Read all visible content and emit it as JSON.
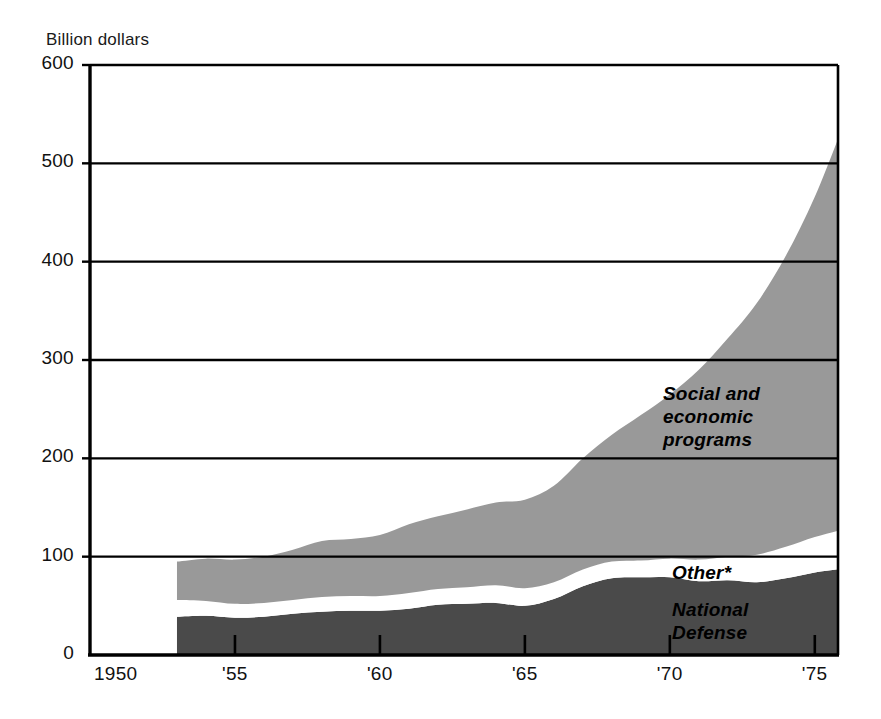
{
  "chart_data": {
    "type": "area",
    "title": "",
    "ylabel": "Billion dollars",
    "xlabel": "",
    "stacked": true,
    "grid": true,
    "legend_position": "inside-plot",
    "ylim": [
      0,
      600
    ],
    "xlim": [
      1950,
      1975.8
    ],
    "ytick_labels": [
      "600",
      "500",
      "400",
      "300",
      "200",
      "100",
      "0"
    ],
    "ytick_values": [
      600,
      500,
      400,
      300,
      200,
      100,
      0
    ],
    "xtick_labels": [
      "1950",
      "'55",
      "'60",
      "'65",
      "'70",
      "'75"
    ],
    "xtick_values": [
      1950,
      1955,
      1960,
      1965,
      1970,
      1975
    ],
    "x": [
      1953,
      1954,
      1955,
      1956,
      1957,
      1958,
      1959,
      1960,
      1961,
      1962,
      1963,
      1964,
      1965,
      1966,
      1967,
      1968,
      1969,
      1970,
      1971,
      1972,
      1973,
      1974,
      1975,
      1976
    ],
    "series": [
      {
        "name": "National Defense",
        "color": "#4a4a4a",
        "label": "National\nDefense",
        "values": [
          39,
          40,
          38,
          39,
          42,
          44,
          45,
          45,
          47,
          51,
          52,
          53,
          50,
          57,
          70,
          78,
          79,
          79,
          75,
          76,
          74,
          78,
          84,
          88
        ]
      },
      {
        "name": "Other*",
        "color": "#ffffff",
        "label": "Other*",
        "values": [
          17,
          15,
          14,
          14,
          14,
          15,
          15,
          15,
          16,
          16,
          17,
          18,
          18,
          17,
          17,
          17,
          17,
          19,
          22,
          24,
          28,
          32,
          36,
          40
        ]
      },
      {
        "name": "Social and economic programs",
        "color": "#999999",
        "label": "Social and\neconomic\nprograms",
        "values": [
          39,
          43,
          45,
          47,
          51,
          57,
          58,
          62,
          70,
          74,
          79,
          84,
          90,
          98,
          113,
          129,
          148,
          167,
          193,
          222,
          256,
          296,
          346,
          412
        ]
      }
    ],
    "totals": [
      95,
      98,
      97,
      100,
      107,
      116,
      118,
      122,
      133,
      141,
      148,
      155,
      158,
      172,
      200,
      224,
      244,
      265,
      290,
      322,
      358,
      406,
      466,
      540
    ],
    "footnote_marker": "*",
    "plot": {
      "left_px": 90,
      "right_px": 838,
      "top_px": 65,
      "bottom_px": 655,
      "data_start_px": 173
    }
  }
}
